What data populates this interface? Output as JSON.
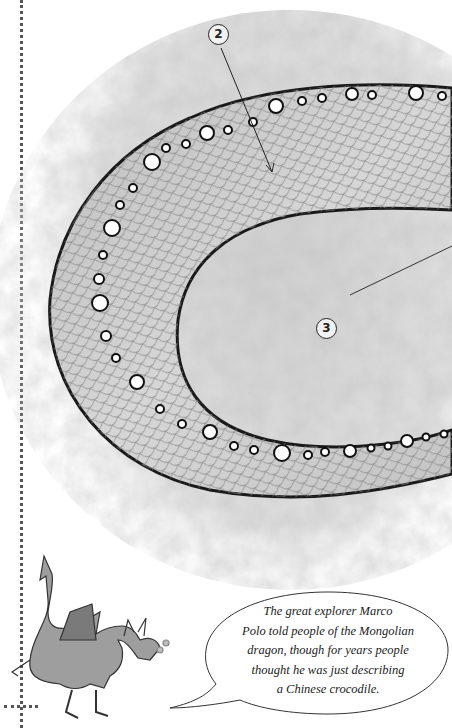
{
  "illustration": {
    "subject": "coiled dragon body with scales",
    "callouts": [
      {
        "number": "2",
        "x": 208,
        "y": 26
      },
      {
        "number": "3",
        "x": 324,
        "y": 317
      }
    ]
  },
  "speech_bubble": {
    "lines": [
      "The great explorer Marco",
      "Polo told people of the Mongolian",
      "dragon, though for years people",
      "thought he was just describing",
      "a Chinese crocodile."
    ]
  },
  "dragon_character": {
    "name": "small-dragon-mascot"
  },
  "colors": {
    "background": "#ffffff",
    "ground_texture": "#d4d4d4",
    "body_fill": "#c8c8c8",
    "outline": "#1a1a1a",
    "scale_line": "#8a8a8a"
  }
}
